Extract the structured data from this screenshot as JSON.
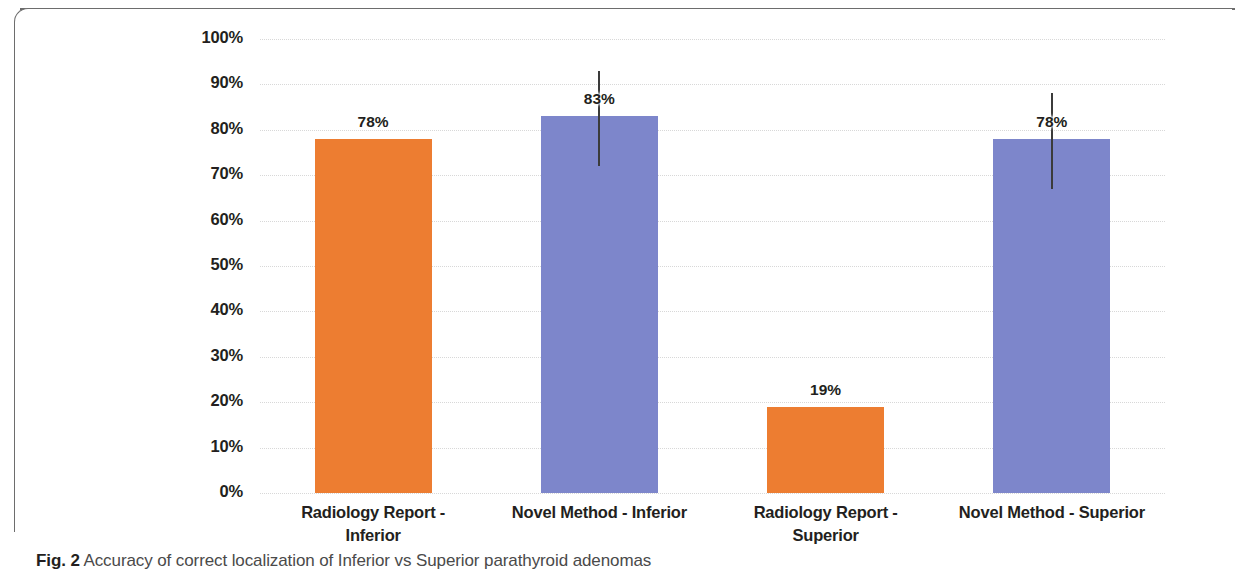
{
  "figure": {
    "caption_label": "Fig. 2",
    "caption_text": " Accuracy of correct localization of Inferior vs Superior parathyroid adenomas"
  },
  "colors": {
    "orange": "#ED7D31",
    "blue": "#7D86CB",
    "gridline": "#d8d8d8",
    "text": "#231f20",
    "errorbar": "#3b3b3b",
    "frame": "#6d6d6d"
  },
  "chart_data": {
    "type": "bar",
    "title": "",
    "xlabel": "",
    "ylabel": "",
    "ylim": [
      0,
      100
    ],
    "yticks": [
      0,
      10,
      20,
      30,
      40,
      50,
      60,
      70,
      80,
      90,
      100
    ],
    "ytick_labels": [
      "0%",
      "10%",
      "20%",
      "30%",
      "40%",
      "50%",
      "60%",
      "70%",
      "80%",
      "90%",
      "100%"
    ],
    "grid": true,
    "legend": "none",
    "categories": [
      "Radiology Report - Inferior",
      "Novel Method - Inferior",
      "Radiology Report - Superior",
      "Novel Method - Superior"
    ],
    "category_lines": [
      [
        "Radiology Report -",
        "Inferior"
      ],
      [
        "Novel Method - Inferior"
      ],
      [
        "Radiology Report -",
        "Superior"
      ],
      [
        "Novel Method - Superior"
      ]
    ],
    "values": [
      78,
      83,
      19,
      78
    ],
    "data_labels": [
      "78%",
      "83%",
      "19%",
      "78%"
    ],
    "bar_colors": [
      "#ED7D31",
      "#7D86CB",
      "#ED7D31",
      "#7D86CB"
    ],
    "error_bars": [
      null,
      {
        "low": 72,
        "high": 93
      },
      null,
      {
        "low": 67,
        "high": 88
      }
    ]
  }
}
